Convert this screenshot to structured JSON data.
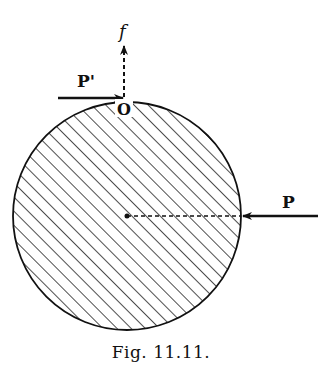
{
  "figure": {
    "caption": "Fig. 11.11.",
    "labels": {
      "friction": "f",
      "force_top": "P'",
      "contact_point": "O",
      "force_right": "P"
    },
    "colors": {
      "ink": "#111111",
      "background": "#ffffff"
    },
    "elements": {
      "disk": "hatched circle",
      "center": "dot at disk center",
      "radius_line": "dashed line from center to right edge",
      "force_P": "solid arrow pointing left at right edge",
      "force_P_prime": "solid arrow pointing right at top contact point O",
      "friction_f": "dashed arrow pointing up from O"
    }
  }
}
